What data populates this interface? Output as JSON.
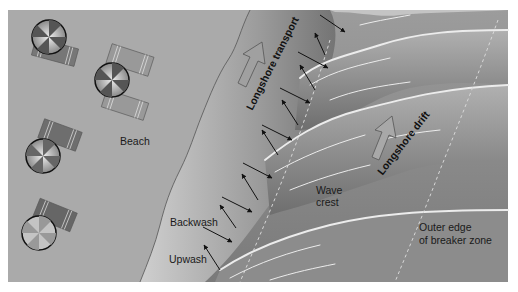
{
  "diagram": {
    "type": "beach-longshore-transport-illustration",
    "colors": {
      "beach": "#a9a9a9",
      "swash_zone_light": "#c8c8c8",
      "swash_zone_dark": "#5e5e5e",
      "water": "#8a8a8a",
      "water_dark": "#6a6a6a",
      "crest_foam": "#e6e6e6",
      "arrow": "#111111",
      "umbrella_rim": "#111111",
      "towel": "#777777",
      "towel_light": "#999999"
    },
    "labels": {
      "beach": "Beach",
      "longshore_transport": "Longshore transport",
      "longshore_drift": "Longshore drift",
      "wave_crest_line1": "Wave",
      "wave_crest_line2": "crest",
      "backwash": "Backwash",
      "upwash": "Upwash",
      "breaker_line1": "Outer edge",
      "breaker_line2": "of breaker zone"
    },
    "icons": {
      "umbrella": "beach-umbrella-icon",
      "towel": "beach-towel-icon",
      "transport_arrow": "hollow-up-arrow-icon",
      "swash_arrow": "swash-arrow-icon"
    },
    "umbrella_count": 5,
    "towel_count": 6
  }
}
